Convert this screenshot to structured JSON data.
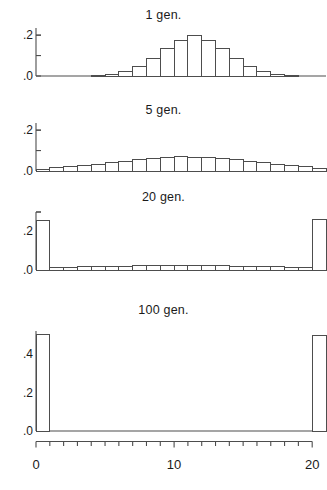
{
  "figure": {
    "kind": "multi-panel-histogram",
    "bin_count": 21,
    "bar_stroke_color": "#4d4d4d",
    "bar_fill_color": "#ffffff",
    "axis_color": "#4d4d4d"
  },
  "xaxis": {
    "label": "",
    "ticks": [
      0,
      1,
      2,
      3,
      4,
      5,
      6,
      7,
      8,
      9,
      10,
      11,
      12,
      13,
      14,
      15,
      16,
      17,
      18,
      19,
      20
    ],
    "tick_labels": [
      {
        "value": 0,
        "text": "0"
      },
      {
        "value": 10,
        "text": "10"
      },
      {
        "value": 20,
        "text": "20"
      }
    ],
    "range": [
      0,
      21
    ]
  },
  "panels": [
    {
      "title": "1 gen.",
      "ylim": [
        0,
        0.235
      ],
      "yticks": [
        0.0,
        0.1,
        0.2
      ],
      "ytick_labels": [
        {
          "value": 0.0,
          "text": ".0"
        },
        {
          "value": 0.1,
          "text": ""
        },
        {
          "value": 0.2,
          "text": ".2"
        }
      ]
    },
    {
      "title": "5 gen.",
      "ylim": [
        0,
        0.235
      ],
      "yticks": [
        0.0,
        0.1,
        0.2
      ],
      "ytick_labels": [
        {
          "value": 0.0,
          "text": ".0"
        },
        {
          "value": 0.1,
          "text": ""
        },
        {
          "value": 0.2,
          "text": ".2"
        }
      ]
    },
    {
      "title": "20 gen.",
      "ylim": [
        0,
        0.3
      ],
      "yticks": [
        0.0,
        0.1,
        0.2,
        0.3
      ],
      "ytick_labels": [
        {
          "value": 0.0,
          "text": ".0"
        },
        {
          "value": 0.1,
          "text": ""
        },
        {
          "value": 0.2,
          "text": ".2"
        },
        {
          "value": 0.3,
          "text": ""
        }
      ]
    },
    {
      "title": "100 gen.",
      "ylim": [
        0,
        0.52
      ],
      "yticks": [
        0.0,
        0.1,
        0.2,
        0.3,
        0.4,
        0.5
      ],
      "ytick_labels": [
        {
          "value": 0.0,
          "text": ".0"
        },
        {
          "value": 0.1,
          "text": ""
        },
        {
          "value": 0.2,
          "text": ".2"
        },
        {
          "value": 0.3,
          "text": ""
        },
        {
          "value": 0.4,
          "text": ".4"
        },
        {
          "value": 0.5,
          "text": ""
        }
      ]
    }
  ],
  "chart_data": {
    "type": "bar",
    "title": "",
    "xlabel": "",
    "ylabel": "",
    "grid": false,
    "legend": null,
    "categories": [
      0,
      1,
      2,
      3,
      4,
      5,
      6,
      7,
      8,
      9,
      10,
      11,
      12,
      13,
      14,
      15,
      16,
      17,
      18,
      19,
      20
    ],
    "panels": [
      {
        "title": "1 gen.",
        "ylim": [
          0,
          0.235
        ],
        "ylabel": "",
        "xlabel": "",
        "values": [
          0.0,
          0.0,
          0.0,
          0.0,
          0.003,
          0.009,
          0.022,
          0.045,
          0.086,
          0.136,
          0.176,
          0.196,
          0.176,
          0.136,
          0.086,
          0.045,
          0.022,
          0.009,
          0.003,
          0.0,
          0.0
        ]
      },
      {
        "title": "5 gen.",
        "ylim": [
          0,
          0.235
        ],
        "ylabel": "",
        "xlabel": "",
        "values": [
          0.006,
          0.016,
          0.022,
          0.026,
          0.034,
          0.04,
          0.048,
          0.054,
          0.06,
          0.064,
          0.07,
          0.068,
          0.064,
          0.06,
          0.054,
          0.048,
          0.04,
          0.034,
          0.026,
          0.02,
          0.012
        ]
      },
      {
        "title": "20 gen.",
        "ylim": [
          0,
          0.3
        ],
        "ylabel": "",
        "xlabel": "",
        "values": [
          0.258,
          0.012,
          0.014,
          0.016,
          0.018,
          0.019,
          0.02,
          0.021,
          0.022,
          0.022,
          0.023,
          0.022,
          0.022,
          0.021,
          0.02,
          0.019,
          0.018,
          0.016,
          0.014,
          0.012,
          0.262
        ]
      },
      {
        "title": "100 gen.",
        "ylim": [
          0,
          0.52
        ],
        "ylabel": "",
        "xlabel": "",
        "values": [
          0.5,
          0.0,
          0.0,
          0.0,
          0.0,
          0.0,
          0.0,
          0.0,
          0.0,
          0.0,
          0.0,
          0.0,
          0.0,
          0.0,
          0.0,
          0.0,
          0.0,
          0.0,
          0.0,
          0.0,
          0.498
        ]
      }
    ],
    "xticks": [
      0,
      1,
      2,
      3,
      4,
      5,
      6,
      7,
      8,
      9,
      10,
      11,
      12,
      13,
      14,
      15,
      16,
      17,
      18,
      19,
      20
    ],
    "xtick_labels": [
      "0",
      "",
      "",
      "",
      "",
      "",
      "",
      "",
      "",
      "",
      "10",
      "",
      "",
      "",
      "",
      "",
      "",
      "",
      "",
      "",
      "20"
    ]
  }
}
